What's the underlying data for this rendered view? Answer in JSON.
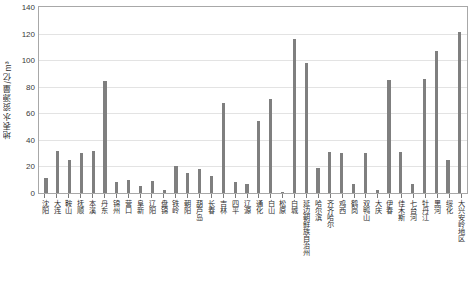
{
  "chart_data": {
    "type": "bar",
    "title": "",
    "xlabel": "",
    "ylabel": "地表水资源量/亿m³",
    "ylim": [
      0,
      140
    ],
    "yticks": [
      0,
      20,
      40,
      60,
      80,
      100,
      120,
      140
    ],
    "grid": true,
    "legend": null,
    "bar_color": "#7f7f7f",
    "categories": [
      "沈阳",
      "大连",
      "鞍山",
      "抚顺",
      "本溪",
      "丹东",
      "锦州",
      "营口",
      "阜新",
      "辽阳",
      "盘锦",
      "铁岭",
      "朝阳",
      "葫芦岛",
      "长春",
      "吉林",
      "四平",
      "辽源",
      "通化",
      "白山",
      "松原",
      "白城",
      "延边朝鲜族自治州",
      "哈尔滨",
      "齐齐哈尔",
      "鸡西",
      "鹤岗",
      "双鸭山",
      "大庆",
      "伊春",
      "佳木斯",
      "七台河",
      "牡丹江",
      "黑河",
      "绥化",
      "大兴安岭地区"
    ],
    "values": [
      11,
      32,
      25,
      30,
      32,
      84,
      8,
      10,
      5,
      9,
      2,
      20,
      15,
      18,
      13,
      68,
      8,
      7,
      54,
      71,
      1,
      116,
      98,
      19,
      31,
      30,
      7,
      30,
      2,
      85,
      31,
      7,
      86,
      107,
      25,
      121
    ],
    "axis_color": "#a8a8a8",
    "gridline_color": "#e3e3e3"
  }
}
